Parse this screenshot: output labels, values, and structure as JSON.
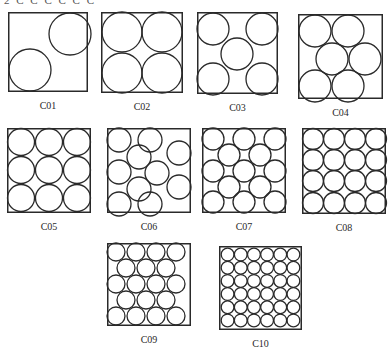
{
  "figure": {
    "top_cut_text": "2  C C C C C C",
    "stroke_color": "#2a2a2a",
    "background": "#ffffff",
    "panels": [
      {
        "id": "C01",
        "label": "C01",
        "box": [
          8,
          12,
          80,
          80
        ],
        "circles": [
          [
            62,
            22,
            21
          ],
          [
            22,
            58,
            21
          ]
        ]
      },
      {
        "id": "C02",
        "label": "C02",
        "box": [
          101,
          12,
          82,
          81
        ],
        "circles": [
          [
            21,
            20,
            20
          ],
          [
            61,
            20,
            20
          ],
          [
            21,
            61,
            20
          ],
          [
            61,
            61,
            20
          ]
        ]
      },
      {
        "id": "C03",
        "label": "C03",
        "box": [
          197,
          12,
          81,
          82
        ],
        "circles": [
          [
            16,
            17,
            16
          ],
          [
            65,
            17,
            16
          ],
          [
            40,
            42,
            16
          ],
          [
            16,
            67,
            16
          ],
          [
            65,
            67,
            16
          ]
        ]
      },
      {
        "id": "C04",
        "label": "C04",
        "box": [
          298,
          14,
          85,
          85
        ],
        "circles": [
          [
            17,
            17,
            16
          ],
          [
            50,
            17,
            16
          ],
          [
            34,
            45,
            16
          ],
          [
            67,
            45,
            16
          ],
          [
            17,
            72,
            16
          ],
          [
            50,
            72,
            16
          ]
        ]
      },
      {
        "id": "C05",
        "label": "C05",
        "box": [
          7,
          128,
          84,
          85
        ],
        "circles": [
          [
            14,
            14,
            13.5
          ],
          [
            42,
            14,
            13.5
          ],
          [
            70,
            14,
            13.5
          ],
          [
            14,
            42,
            13.5
          ],
          [
            42,
            42,
            13.5
          ],
          [
            70,
            42,
            13.5
          ],
          [
            14,
            70,
            13.5
          ],
          [
            42,
            70,
            13.5
          ],
          [
            70,
            70,
            13.5
          ]
        ]
      },
      {
        "id": "C06",
        "label": "C06",
        "box": [
          107,
          128,
          84,
          85
        ],
        "circles": [
          [
            12,
            12,
            12
          ],
          [
            43,
            12,
            12
          ],
          [
            72,
            25,
            12
          ],
          [
            32,
            29,
            12
          ],
          [
            12,
            44,
            12
          ],
          [
            50,
            45,
            12
          ],
          [
            32,
            61,
            12
          ],
          [
            72,
            59,
            12
          ],
          [
            12,
            76,
            12
          ],
          [
            43,
            76,
            12
          ]
        ]
      },
      {
        "id": "C07",
        "label": "C07",
        "box": [
          202,
          128,
          84,
          85
        ],
        "circles": [
          [
            11,
            11,
            11
          ],
          [
            42,
            11,
            11
          ],
          [
            73,
            11,
            11
          ],
          [
            27,
            27,
            11
          ],
          [
            58,
            27,
            11
          ],
          [
            11,
            43,
            11
          ],
          [
            42,
            43,
            11
          ],
          [
            73,
            43,
            11
          ],
          [
            27,
            59,
            11
          ],
          [
            58,
            59,
            11
          ],
          [
            11,
            74,
            11
          ],
          [
            42,
            74,
            11
          ],
          [
            73,
            74,
            11
          ]
        ]
      },
      {
        "id": "C08",
        "label": "C08",
        "box": [
          302,
          128,
          84,
          86
        ],
        "circles": [
          [
            11,
            11,
            10.5
          ],
          [
            32,
            11,
            10.5
          ],
          [
            53,
            11,
            10.5
          ],
          [
            74,
            11,
            10.5
          ],
          [
            11,
            32,
            10.5
          ],
          [
            32,
            32,
            10.5
          ],
          [
            53,
            32,
            10.5
          ],
          [
            74,
            32,
            10.5
          ],
          [
            11,
            53,
            10.5
          ],
          [
            32,
            53,
            10.5
          ],
          [
            53,
            53,
            10.5
          ],
          [
            74,
            53,
            10.5
          ],
          [
            11,
            75,
            10.5
          ],
          [
            32,
            75,
            10.5
          ],
          [
            53,
            75,
            10.5
          ],
          [
            74,
            75,
            10.5
          ]
        ]
      },
      {
        "id": "C09",
        "label": "C09",
        "box": [
          107,
          243,
          84,
          83
        ],
        "circles": [
          [
            9,
            9,
            9
          ],
          [
            29,
            9,
            9
          ],
          [
            49,
            9,
            9
          ],
          [
            69,
            9,
            9
          ],
          [
            19,
            25,
            9
          ],
          [
            39,
            25,
            9
          ],
          [
            59,
            25,
            9
          ],
          [
            9,
            41,
            9
          ],
          [
            29,
            41,
            9
          ],
          [
            49,
            41,
            9
          ],
          [
            69,
            41,
            9
          ],
          [
            19,
            57,
            9
          ],
          [
            39,
            57,
            9
          ],
          [
            59,
            57,
            9
          ],
          [
            9,
            73,
            9
          ],
          [
            29,
            73,
            9
          ],
          [
            49,
            73,
            9
          ],
          [
            69,
            73,
            9
          ]
        ]
      },
      {
        "id": "C10",
        "label": "C10",
        "box": [
          219,
          246,
          83,
          84
        ],
        "circles": "grid-6x6"
      }
    ]
  }
}
